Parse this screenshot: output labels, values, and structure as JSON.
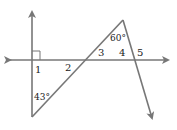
{
  "diagram": {
    "labels": {
      "angle1": "1",
      "angle2": "2",
      "angle3": "3",
      "angle4": "4",
      "angle5": "5",
      "angle_apex": "60°",
      "angle_bottom": "43°"
    },
    "colors": {
      "line": "#777777",
      "text": "#222222"
    }
  }
}
